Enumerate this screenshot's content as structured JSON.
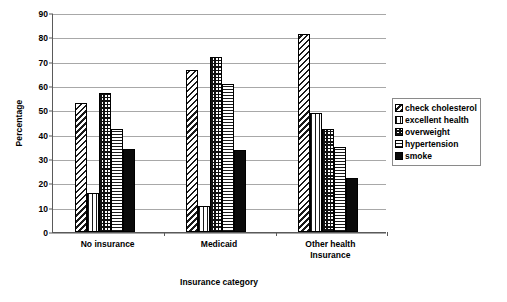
{
  "chart_data": {
    "type": "bar",
    "title": "",
    "xlabel": "Insurance category",
    "ylabel": "Percentage",
    "ylim": [
      0,
      90
    ],
    "ytick_step": 10,
    "yticks": [
      0,
      10,
      20,
      30,
      40,
      50,
      60,
      70,
      80,
      90
    ],
    "grid": true,
    "legend_position": "right",
    "categories": [
      "No insurance",
      "Medicaid",
      "Other health\nInsurance"
    ],
    "series": [
      {
        "name": "check cholesterol",
        "pattern": "diagonal-stripes",
        "values": [
          53,
          66.5,
          81.5
        ]
      },
      {
        "name": "excellent health",
        "pattern": "vertical-stripes",
        "values": [
          16,
          10.5,
          49
        ]
      },
      {
        "name": "overweight",
        "pattern": "checkered",
        "values": [
          57,
          72,
          42.5
        ]
      },
      {
        "name": "hypertension",
        "pattern": "horizontal-stripes",
        "values": [
          42.5,
          61,
          35
        ]
      },
      {
        "name": "smoke",
        "pattern": "solid-black",
        "values": [
          34,
          33.5,
          22
        ]
      }
    ]
  },
  "legend": {
    "items": [
      {
        "label": "check cholesterol"
      },
      {
        "label": "excellent health"
      },
      {
        "label": "overweight"
      },
      {
        "label": "hypertension"
      },
      {
        "label": "smoke"
      }
    ]
  },
  "axis": {
    "y_title": "Percentage",
    "x_title": "Insurance category",
    "y_tick_labels": [
      "90",
      "80",
      "70",
      "60",
      "50",
      "40",
      "30",
      "20",
      "10",
      "0"
    ],
    "x_tick_labels": [
      "No insurance",
      "Medicaid",
      "Other health\nInsurance"
    ]
  },
  "colors": {
    "axis": "#5a5a5a",
    "gridline": "#a8a8a8",
    "ink": "#000000",
    "background": "#ffffff",
    "solid_series": "#0a0a0a"
  }
}
